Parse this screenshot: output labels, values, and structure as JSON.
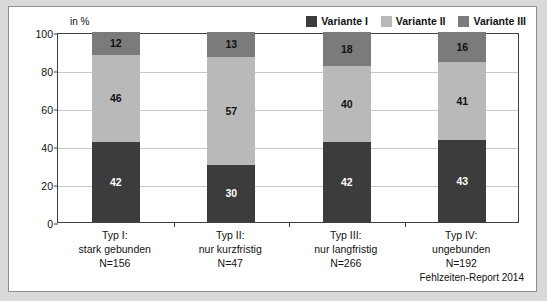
{
  "figure": {
    "axis_unit_label": "in %",
    "source_note": "Fehlzeiten-Report 2014"
  },
  "legend": {
    "items": [
      {
        "label": "Variante I",
        "color": "#3c3c3c"
      },
      {
        "label": "Variante II",
        "color": "#b9b9b9"
      },
      {
        "label": "Variante III",
        "color": "#7b7b7b"
      }
    ]
  },
  "chart_data": {
    "type": "bar",
    "title": "",
    "subtitle": "",
    "xlabel": "",
    "ylabel": "in %",
    "ylim": [
      0,
      100
    ],
    "yticks": [
      0,
      20,
      40,
      60,
      80,
      100
    ],
    "grid": true,
    "stacked": true,
    "legend_position": "top-right",
    "categories": [
      "Typ I:\nstark gebunden\nN=156",
      "Typ II:\nnur kurzfristig\nN=47",
      "Typ III:\nnur langfristig\nN=266",
      "Typ IV:\nungebunden\nN=192"
    ],
    "category_details": [
      {
        "line1": "Typ I:",
        "line2": "stark gebunden",
        "line3": "N=156"
      },
      {
        "line1": "Typ II:",
        "line2": "nur kurzfristig",
        "line3": "N=47"
      },
      {
        "line1": "Typ III:",
        "line2": "nur langfristig",
        "line3": "N=266"
      },
      {
        "line1": "Typ IV:",
        "line2": "ungebunden",
        "line3": "N=192"
      }
    ],
    "series": [
      {
        "name": "Variante I",
        "color": "#3c3c3c",
        "label_color": "#ffffff",
        "values": [
          42,
          30,
          42,
          43
        ]
      },
      {
        "name": "Variante II",
        "color": "#b9b9b9",
        "label_color": "#111111",
        "values": [
          46,
          57,
          40,
          41
        ]
      },
      {
        "name": "Variante III",
        "color": "#7b7b7b",
        "label_color": "#111111",
        "values": [
          12,
          13,
          18,
          16
        ]
      }
    ]
  }
}
